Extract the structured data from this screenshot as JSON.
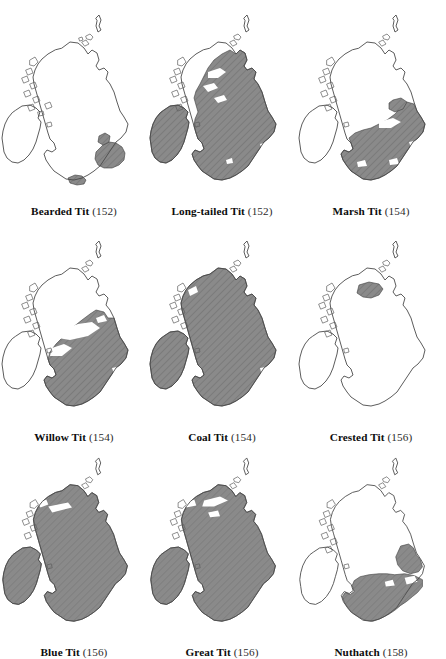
{
  "figure": {
    "type": "distribution-map-grid",
    "rows": 3,
    "columns": 3,
    "region_depicted": "British Isles",
    "colors": {
      "background": "#ffffff",
      "range_fill": "#8a8a8a",
      "hatch_line": "#6f6f6f",
      "coastline": "#4a4a4a",
      "caption_text": "#0d0d0d"
    }
  },
  "maps": [
    {
      "id": "bearded-tit",
      "species": "Bearded Tit",
      "page": "(152)",
      "row": 1,
      "column": 1,
      "coverage": "very-restricted",
      "range_regions": [
        "East Anglia",
        "Norfolk Broads",
        "Thames Estuary",
        "South Coast",
        "Somerset Levels"
      ]
    },
    {
      "id": "long-tailed-tit",
      "species": "Long-tailed Tit",
      "page": "(152)",
      "row": 1,
      "column": 2,
      "coverage": "widespread",
      "range_regions": [
        "Ireland",
        "Wales",
        "England",
        "Southern Scotland",
        "Eastern Scotland"
      ]
    },
    {
      "id": "marsh-tit",
      "species": "Marsh Tit",
      "page": "(154)",
      "row": 1,
      "column": 3,
      "coverage": "england-wales",
      "range_regions": [
        "England",
        "Wales",
        "Northern England",
        "Southern England"
      ]
    },
    {
      "id": "willow-tit",
      "species": "Willow Tit",
      "page": "(154)",
      "row": 2,
      "column": 1,
      "coverage": "britain-partial",
      "range_regions": [
        "England",
        "Wales",
        "Southern Scotland",
        "Northern England"
      ]
    },
    {
      "id": "coal-tit",
      "species": "Coal Tit",
      "page": "(154)",
      "row": 2,
      "column": 2,
      "coverage": "near-complete",
      "range_regions": [
        "Ireland",
        "Wales",
        "England",
        "Scotland"
      ]
    },
    {
      "id": "crested-tit",
      "species": "Crested Tit",
      "page": "(156)",
      "row": 2,
      "column": 3,
      "coverage": "highly-localised",
      "range_regions": [
        "Scottish Highlands",
        "Speyside"
      ]
    },
    {
      "id": "blue-tit",
      "species": "Blue Tit",
      "page": "(156)",
      "row": 3,
      "column": 1,
      "coverage": "near-complete",
      "range_regions": [
        "Ireland",
        "Wales",
        "England",
        "Scotland"
      ]
    },
    {
      "id": "great-tit",
      "species": "Great Tit",
      "page": "(156)",
      "row": 3,
      "column": 2,
      "coverage": "near-complete",
      "range_regions": [
        "Ireland",
        "Wales",
        "England",
        "Scotland"
      ]
    },
    {
      "id": "nuthatch",
      "species": "Nuthatch",
      "page": "(158)",
      "row": 3,
      "column": 3,
      "coverage": "england-wales",
      "range_regions": [
        "England",
        "Wales",
        "Northern England"
      ]
    }
  ]
}
